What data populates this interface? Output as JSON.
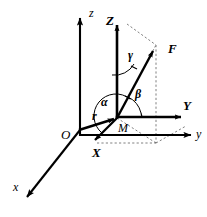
{
  "figure": {
    "background_color": "#ffffff",
    "stroke_color": "#000000",
    "dashed_color": "#555555",
    "width": 207,
    "height": 217
  },
  "labels": {
    "origin": "O",
    "point_m": "M",
    "axis_x_lower": "x",
    "axis_y_lower": "y",
    "axis_z_lower": "z",
    "axis_X_upper": "X",
    "axis_Y_upper": "Y",
    "axis_Z_upper": "Z",
    "vector_r": "r",
    "vector_F": "F",
    "angle_alpha": "α",
    "angle_beta": "β",
    "angle_gamma": "γ"
  },
  "elements": {
    "global_frame": {
      "name": "global coordinate system Oxyz",
      "origin_label": "O",
      "axes": [
        "x",
        "y",
        "z"
      ]
    },
    "local_frame": {
      "name": "local coordinate system MXYZ",
      "origin_label": "M",
      "axes": [
        "X",
        "Y",
        "Z"
      ]
    },
    "vectors": [
      {
        "label": "r",
        "from": "O",
        "to": "M",
        "style": "solid-bold"
      },
      {
        "label": "F",
        "from": "M",
        "to": "force tip",
        "style": "solid-bold"
      }
    ],
    "angles": [
      {
        "label": "α",
        "between": [
          "F",
          "X"
        ]
      },
      {
        "label": "β",
        "between": [
          "F",
          "Y"
        ]
      },
      {
        "label": "γ",
        "between": [
          "F",
          "Z"
        ]
      }
    ]
  }
}
